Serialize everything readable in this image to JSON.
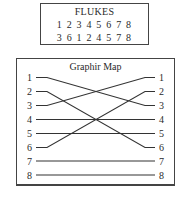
{
  "flukes": {
    "title": "FLUKES",
    "row1": "1 2 3 4 5 6 7 8",
    "row2": "3 6 1 2 4 5 7 8"
  },
  "graphir_map": {
    "title": "Graphir Map",
    "left_labels": [
      "1",
      "2",
      "3",
      "4",
      "5",
      "6",
      "7",
      "8"
    ],
    "right_labels": [
      "1",
      "2",
      "3",
      "4",
      "5",
      "6",
      "7",
      "8"
    ],
    "connections": [
      {
        "from": 1,
        "to": 3
      },
      {
        "from": 2,
        "to": 6
      },
      {
        "from": 3,
        "to": 1
      },
      {
        "from": 4,
        "to": 4
      },
      {
        "from": 5,
        "to": 5
      },
      {
        "from": 6,
        "to": 2
      },
      {
        "from": 7,
        "to": 7
      },
      {
        "from": 8,
        "to": 8
      }
    ],
    "line_color": "#333333"
  }
}
